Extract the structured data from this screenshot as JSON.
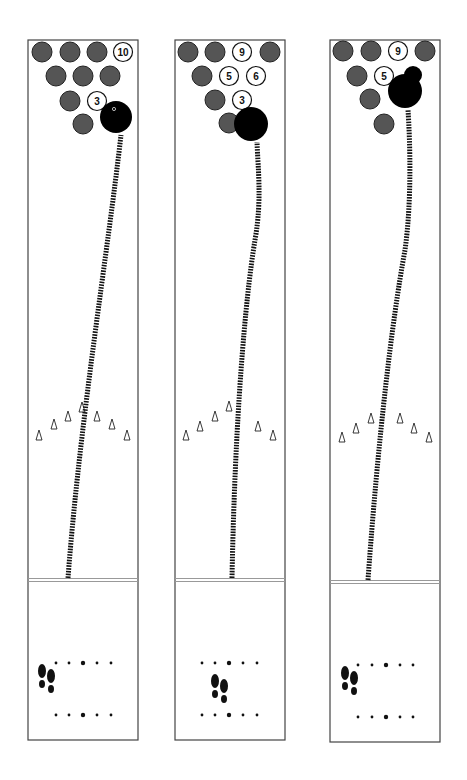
{
  "diagram": {
    "type": "bowling-lane-diagrams",
    "colors": {
      "pin_standing": "#555555",
      "pin_dark_edge": "#222222",
      "ball": "#000000",
      "lane_border": "#444444",
      "foul_line": "#999999",
      "track": "#111111"
    },
    "lanes": [
      {
        "id": "lane-1",
        "x": 28,
        "width": 110,
        "top": 40,
        "foul_y": 580,
        "bottom": 740,
        "pins": [
          {
            "cx": 42,
            "cy": 52,
            "down": true
          },
          {
            "cx": 70,
            "cy": 52,
            "down": true
          },
          {
            "cx": 97,
            "cy": 52,
            "down": true
          },
          {
            "cx": 123,
            "cy": 52,
            "down": false,
            "label": "10"
          },
          {
            "cx": 56,
            "cy": 76,
            "down": true
          },
          {
            "cx": 83,
            "cy": 76,
            "down": true
          },
          {
            "cx": 110,
            "cy": 76,
            "down": true
          },
          {
            "cx": 70,
            "cy": 101,
            "down": true
          },
          {
            "cx": 97,
            "cy": 101,
            "down": false,
            "label": "3"
          },
          {
            "cx": 83,
            "cy": 124,
            "down": true
          }
        ],
        "ball": {
          "cx": 116,
          "cy": 117,
          "r": 16
        },
        "track": "M68,578 C80,420 108,250 121,135",
        "arrows_y": [
          437,
          426,
          418,
          409,
          418,
          426,
          437
        ],
        "arrows_x": [
          39,
          54,
          68,
          82,
          97,
          112,
          127
        ],
        "dots_top_y": 663,
        "dots_bottom_y": 715,
        "dots_x": [
          56,
          69,
          83,
          97,
          111
        ],
        "feet": {
          "x": 42,
          "y": 680
        }
      },
      {
        "id": "lane-2",
        "x": 175,
        "width": 110,
        "top": 40,
        "foul_y": 580,
        "bottom": 740,
        "pins": [
          {
            "cx": 188,
            "cy": 52,
            "down": true
          },
          {
            "cx": 215,
            "cy": 52,
            "down": true
          },
          {
            "cx": 242,
            "cy": 52,
            "down": false,
            "label": "9"
          },
          {
            "cx": 270,
            "cy": 52,
            "down": true
          },
          {
            "cx": 202,
            "cy": 76,
            "down": true
          },
          {
            "cx": 229,
            "cy": 76,
            "down": false,
            "label": "5"
          },
          {
            "cx": 256,
            "cy": 76,
            "down": false,
            "label": "6"
          },
          {
            "cx": 215,
            "cy": 100,
            "down": true
          },
          {
            "cx": 242,
            "cy": 100,
            "down": false,
            "label": "3"
          },
          {
            "cx": 229,
            "cy": 123,
            "down": true
          }
        ],
        "ball": {
          "cx": 251,
          "cy": 124,
          "r": 17
        },
        "track": "M232,578 C235,420 245,300 255,240 C262,200 258,170 257,142",
        "arrows_y": [
          437,
          428,
          418,
          408,
          428,
          437
        ],
        "arrows_x": [
          186,
          200,
          215,
          229,
          258,
          273
        ],
        "dots_top_y": 663,
        "dots_bottom_y": 715,
        "dots_x": [
          202,
          215,
          229,
          243,
          257
        ],
        "feet": {
          "x": 215,
          "y": 690
        }
      },
      {
        "id": "lane-3",
        "x": 330,
        "width": 110,
        "top": 40,
        "foul_y": 582,
        "bottom": 742,
        "pins": [
          {
            "cx": 343,
            "cy": 51,
            "down": true
          },
          {
            "cx": 371,
            "cy": 51,
            "down": true
          },
          {
            "cx": 398,
            "cy": 51,
            "down": false,
            "label": "9"
          },
          {
            "cx": 425,
            "cy": 51,
            "down": true
          },
          {
            "cx": 357,
            "cy": 76,
            "down": true
          },
          {
            "cx": 384,
            "cy": 76,
            "down": false,
            "label": "5"
          },
          {
            "cx": 370,
            "cy": 99,
            "down": true
          },
          {
            "cx": 384,
            "cy": 124,
            "down": true
          }
        ],
        "ball": {
          "cx": 405,
          "cy": 91,
          "r": 17
        },
        "ball_extra": {
          "cx": 413,
          "cy": 75,
          "r": 9
        },
        "track": "M368,580 C378,440 392,320 405,250 C412,200 410,140 408,110",
        "arrows_y": [
          439,
          430,
          420,
          420,
          430,
          439
        ],
        "arrows_x": [
          342,
          356,
          371,
          400,
          414,
          429
        ],
        "dots_top_y": 665,
        "dots_bottom_y": 717,
        "dots_x": [
          358,
          372,
          386,
          400,
          413
        ],
        "feet": {
          "x": 345,
          "y": 682
        }
      }
    ]
  }
}
